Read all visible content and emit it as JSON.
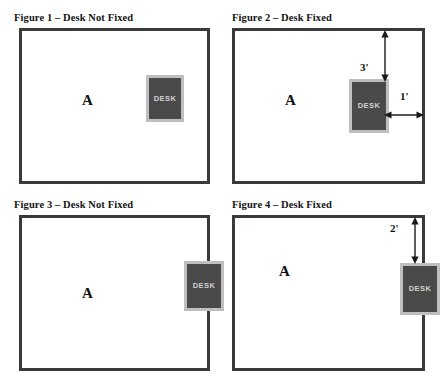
{
  "sheet": {
    "occupant_label": "A",
    "desk_label": "DESK"
  },
  "figures": [
    {
      "id": "figure-1",
      "title": "Figure 1 – Desk Not Fixed",
      "fixed": false,
      "occupant": "A",
      "desk_label": "DESK",
      "dimensions": []
    },
    {
      "id": "figure-2",
      "title": "Figure 2 – Desk Fixed",
      "fixed": true,
      "occupant": "A",
      "desk_label": "DESK",
      "dimensions": [
        {
          "name": "top-clearance",
          "value": "3'",
          "orientation": "vertical"
        },
        {
          "name": "right-clearance",
          "value": "1'",
          "orientation": "horizontal"
        }
      ]
    },
    {
      "id": "figure-3",
      "title": "Figure 3 – Desk Not Fixed",
      "fixed": false,
      "occupant": "A",
      "desk_label": "DESK",
      "dimensions": []
    },
    {
      "id": "figure-4",
      "title": "Figure 4 – Desk Fixed",
      "fixed": true,
      "occupant": "A",
      "desk_label": "DESK",
      "dimensions": [
        {
          "name": "top-clearance",
          "value": "2'",
          "orientation": "vertical"
        }
      ]
    }
  ],
  "colors": {
    "wall": "#3a3a3a",
    "desk_fill": "#4a4a4a",
    "desk_border": "#bfbfbf",
    "desk_text": "#d2d2d2",
    "text": "#141414",
    "background": "#ffffff"
  }
}
